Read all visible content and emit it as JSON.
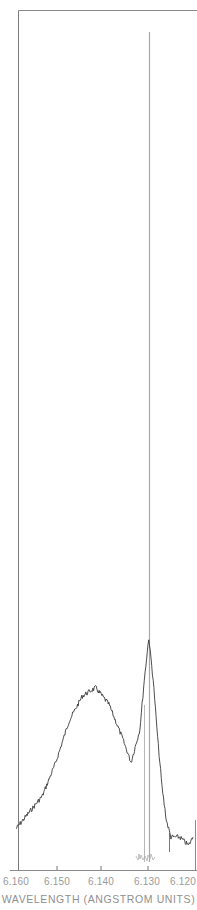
{
  "chart_data": {
    "type": "line",
    "title": "",
    "xlabel": "WAVELENGTH (ANGSTROM UNITS)",
    "ylabel": "",
    "x_reversed": true,
    "xlim": [
      6.16,
      6.12
    ],
    "x_ticks": [
      "6.160",
      "6.150",
      "6.140",
      "6.130",
      "6.120"
    ],
    "grid": false,
    "legend": null,
    "series": [
      {
        "name": "broad emission spectrum (noisy)",
        "color": "#3a3a3a",
        "x": [
          6.16,
          6.157,
          6.154,
          6.151,
          6.148,
          6.145,
          6.142,
          6.139,
          6.136,
          6.134,
          6.132,
          6.131,
          6.13,
          6.129,
          6.128,
          6.127,
          6.126,
          6.125,
          6.123,
          6.121,
          6.12
        ],
        "y": [
          0.04,
          0.06,
          0.08,
          0.12,
          0.17,
          0.2,
          0.21,
          0.19,
          0.15,
          0.12,
          0.16,
          0.22,
          0.27,
          0.22,
          0.15,
          0.09,
          0.05,
          0.03,
          0.03,
          0.02,
          0.03
        ]
      },
      {
        "name": "narrow laser line",
        "color": "#a8a8a8",
        "x": [
          6.1305,
          6.1305,
          6.1305
        ],
        "y": [
          0.0,
          1.0,
          0.0
        ]
      },
      {
        "name": "second narrow line",
        "color": "#b5b5b5",
        "x": [
          6.1315,
          6.1315,
          6.1315
        ],
        "y": [
          0.0,
          0.13,
          0.0
        ]
      }
    ],
    "annotations": []
  },
  "axis": {
    "x_ticks": [
      "6.160",
      "6.150",
      "6.140",
      "6.130",
      "6.120"
    ],
    "x_title": "WAVELENGTH (ANGSTROM UNITS)"
  }
}
